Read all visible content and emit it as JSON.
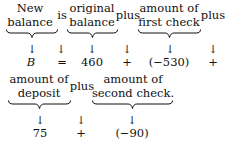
{
  "row1": {
    "groups": [
      {
        "line1": "New",
        "line2": "balance",
        "value": "B"
      },
      {
        "line1": "original",
        "line2": "balance",
        "value": "460"
      },
      {
        "line1": "amount of",
        "line2": "first check",
        "value": "(−530)"
      }
    ],
    "connectors": [
      {
        "word": "is",
        "symbol": "="
      },
      {
        "word": "plus",
        "symbol": "+"
      },
      {
        "word": "plus",
        "symbol": "+"
      }
    ]
  },
  "row2": {
    "groups": [
      {
        "line1": "amount of",
        "line2": "deposit",
        "value": "75"
      },
      {
        "line1": "amount of",
        "line2": "second check.",
        "value": "(−90)"
      }
    ],
    "connectors": [
      {
        "word": "plus",
        "symbol": "+"
      }
    ]
  },
  "arrow_glyph": "↓"
}
